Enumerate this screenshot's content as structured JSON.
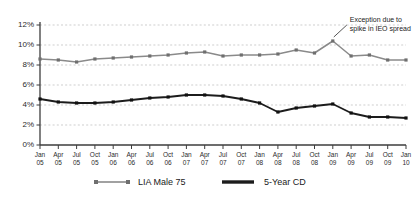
{
  "chart_data": {
    "type": "line",
    "title": "",
    "subtitle": "",
    "xlabel": "",
    "ylabel": "",
    "grid": true,
    "legend_position": "bottom",
    "ylim": [
      0,
      12
    ],
    "ytick_step": 2,
    "ytick_labels": [
      "0%",
      "2%",
      "4%",
      "6%",
      "8%",
      "10%",
      "12%"
    ],
    "ytick_values": [
      0,
      2,
      4,
      6,
      8,
      10,
      12
    ],
    "categories": [
      "Jan 05",
      "Apr 05",
      "Jul 05",
      "Oct 05",
      "Jan 06",
      "Apr 06",
      "Jul 06",
      "Oct 06",
      "Jan 07",
      "Apr 07",
      "Jul 07",
      "Oct 07",
      "Jan 08",
      "Apr 08",
      "Jul 08",
      "Oct 08",
      "Jan 09",
      "Apr 09",
      "Jul 09",
      "Oct 09",
      "Jan 10"
    ],
    "category_lines": [
      [
        "Jan",
        "05"
      ],
      [
        "Apr",
        "05"
      ],
      [
        "Jul",
        "05"
      ],
      [
        "Oct",
        "05"
      ],
      [
        "Jan",
        "06"
      ],
      [
        "Apr",
        "06"
      ],
      [
        "Jul",
        "06"
      ],
      [
        "Oct",
        "06"
      ],
      [
        "Jan",
        "07"
      ],
      [
        "Apr",
        "07"
      ],
      [
        "Jul",
        "07"
      ],
      [
        "Oct",
        "07"
      ],
      [
        "Jan",
        "08"
      ],
      [
        "Apr",
        "08"
      ],
      [
        "Jul",
        "08"
      ],
      [
        "Oct",
        "08"
      ],
      [
        "Jan",
        "09"
      ],
      [
        "Apr",
        "09"
      ],
      [
        "Jul",
        "09"
      ],
      [
        "Oct",
        "09"
      ],
      [
        "Jan",
        "10"
      ]
    ],
    "series": [
      {
        "name": "LIA Male 75",
        "color": "#8a8a8a",
        "marker": true,
        "values": [
          8.6,
          8.5,
          8.3,
          8.6,
          8.7,
          8.8,
          8.9,
          9.0,
          9.2,
          9.3,
          8.9,
          9.0,
          9.0,
          9.1,
          9.5,
          9.2,
          10.4,
          8.9,
          9.0,
          8.5,
          8.5
        ]
      },
      {
        "name": "5-Year CD",
        "color": "#1c1c1c",
        "marker": true,
        "values": [
          4.6,
          4.3,
          4.2,
          4.2,
          4.3,
          4.5,
          4.7,
          4.8,
          5.0,
          5.0,
          4.9,
          4.6,
          4.2,
          3.3,
          3.7,
          3.9,
          4.1,
          3.2,
          2.8,
          2.8,
          2.7
        ]
      }
    ],
    "annotations": [
      {
        "id": "exception-note",
        "lines": [
          "Exception due to",
          "spike in IEO spread"
        ],
        "points_at_category": "Jan 09",
        "points_at_series": "LIA Male 75"
      }
    ]
  },
  "legend": {
    "items": [
      {
        "label": "LIA Male 75",
        "color": "#8a8a8a"
      },
      {
        "label": "5-Year CD",
        "color": "#1c1c1c"
      }
    ]
  },
  "colors": {
    "grid": "#b9b9b9",
    "axis": "#3d3d3d",
    "series_gray": "#8a8a8a",
    "series_black": "#1c1c1c",
    "background": "#ffffff"
  }
}
